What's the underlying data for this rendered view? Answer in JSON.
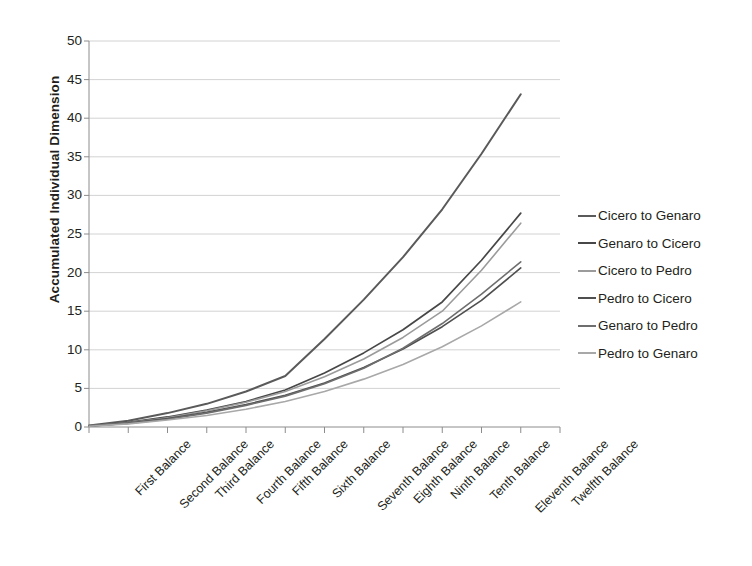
{
  "chart_data": {
    "type": "line",
    "title": "",
    "xlabel": "",
    "ylabel": "Accumulated Individual Dimension",
    "ylim": [
      0,
      50
    ],
    "ytick_step": 5,
    "yticks": [
      0,
      5,
      10,
      15,
      20,
      25,
      30,
      35,
      40,
      45,
      50
    ],
    "grid": true,
    "grid_axis": "y",
    "legend_position": "right",
    "categories": [
      "First Balance",
      "Second Balance",
      "Third Balance",
      "Fourth Balance",
      "Fifth Balance",
      "Sixth Balance",
      "Seventh Balance",
      "Eighth Balance",
      "Ninth Balance",
      "Tenth Balance",
      "Eleventh Balance",
      "Twelfth Balance"
    ],
    "series": [
      {
        "name": "Cicero to Genaro",
        "color": "#5a5a5a",
        "width": 2.0,
        "values": [
          0.2,
          0.8,
          1.8,
          3.0,
          4.6,
          6.6,
          11.4,
          16.5,
          22.0,
          28.2,
          35.4,
          43.1
        ]
      },
      {
        "name": "Genaro to Cicero",
        "color": "#474747",
        "width": 1.7,
        "values": [
          0.15,
          0.6,
          1.3,
          2.2,
          3.3,
          4.8,
          7.0,
          9.6,
          12.6,
          16.2,
          21.6,
          27.7
        ]
      },
      {
        "name": "Cicero to Pedro",
        "color": "#9b9b9b",
        "width": 1.6,
        "values": [
          0.15,
          0.55,
          1.2,
          2.1,
          3.2,
          4.6,
          6.5,
          8.8,
          11.6,
          15.0,
          20.3,
          26.4
        ]
      },
      {
        "name": "Pedro to Cicero",
        "color": "#4f4f4f",
        "width": 1.7,
        "values": [
          0.12,
          0.5,
          1.1,
          1.9,
          2.9,
          4.1,
          5.7,
          7.7,
          10.1,
          13.0,
          16.4,
          20.6
        ]
      },
      {
        "name": "Genaro to Pedro",
        "color": "#6e6e6e",
        "width": 1.6,
        "values": [
          0.12,
          0.45,
          1.0,
          1.8,
          2.8,
          4.0,
          5.6,
          7.6,
          10.2,
          13.4,
          17.2,
          21.4
        ]
      },
      {
        "name": "Pedro to Genaro",
        "color": "#a8a8a8",
        "width": 1.6,
        "values": [
          0.1,
          0.4,
          0.9,
          1.5,
          2.3,
          3.3,
          4.6,
          6.2,
          8.1,
          10.4,
          13.1,
          16.2
        ]
      }
    ]
  },
  "axis": {
    "y_title": "Accumulated Individual Dimension",
    "y_tick_labels": [
      "50",
      "45",
      "40",
      "35",
      "30",
      "25",
      "20",
      "15",
      "10",
      "5",
      "0"
    ]
  },
  "legend": {
    "items": [
      {
        "label": "Cicero to Genaro"
      },
      {
        "label": "Genaro to Cicero"
      },
      {
        "label": "Cicero to Pedro"
      },
      {
        "label": "Pedro to Cicero"
      },
      {
        "label": "Genaro to Pedro"
      },
      {
        "label": "Pedro to Genaro"
      }
    ]
  },
  "style": {
    "grid_color": "#c7c7c7",
    "axis_color": "#8c8c8c",
    "text_color": "#231f20",
    "background": "#ffffff"
  }
}
